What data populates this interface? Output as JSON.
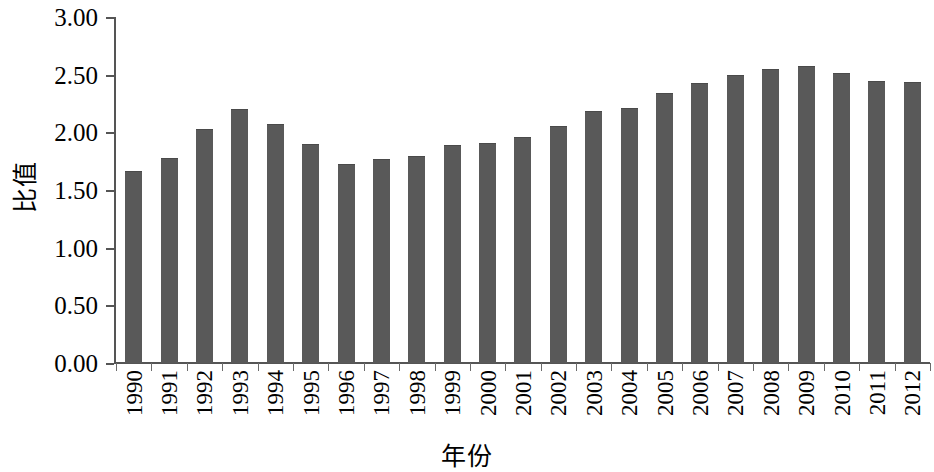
{
  "chart_data": {
    "type": "bar",
    "title": "",
    "xlabel": "年份",
    "ylabel": "比值",
    "categories": [
      "1990",
      "1991",
      "1992",
      "1993",
      "1994",
      "1995",
      "1996",
      "1997",
      "1998",
      "1999",
      "2000",
      "2001",
      "2002",
      "2003",
      "2004",
      "2005",
      "2006",
      "2007",
      "2008",
      "2009",
      "2010",
      "2011",
      "2012"
    ],
    "values": [
      1.66,
      1.77,
      2.02,
      2.19,
      2.06,
      1.89,
      1.72,
      1.76,
      1.79,
      1.88,
      1.9,
      1.95,
      2.05,
      2.18,
      2.2,
      2.33,
      2.42,
      2.49,
      2.54,
      2.57,
      2.51,
      2.44,
      2.43
    ],
    "ylim": [
      0,
      3.0
    ],
    "ytick_values": [
      3.0,
      2.5,
      2.0,
      1.5,
      1.0,
      0.5,
      0.0
    ],
    "ytick_labels": [
      "3.00",
      "2.50",
      "2.00",
      "1.50",
      "1.00",
      "0.50",
      "0.00"
    ],
    "grid": false,
    "legend": null,
    "series_color": "#595959",
    "axis_color": "#555555"
  }
}
